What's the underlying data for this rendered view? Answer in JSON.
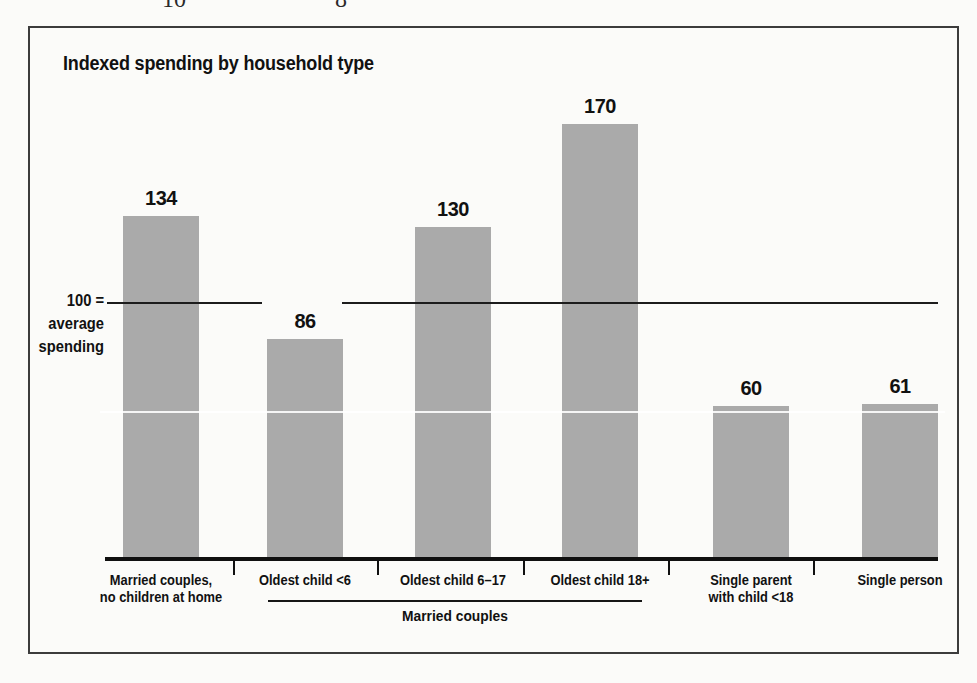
{
  "page": {
    "top_fragments": [
      "10",
      "8"
    ]
  },
  "chart": {
    "title": "Indexed spending by household type",
    "reference_line": {
      "lines": [
        "100 =",
        "average",
        "spending"
      ],
      "value": 100
    },
    "group_bracket_label": "Married couples",
    "colors": {
      "bar_fill": "#aaaaaa",
      "line": "#1c1c1c",
      "frame_border": "#3c3c3c",
      "text": "#111111",
      "background": "#fbfbf9"
    }
  },
  "chart_data": {
    "type": "bar",
    "title": "Indexed spending by household type",
    "categories": [
      "Married couples,\nno children at home",
      "Oldest child <6",
      "Oldest child 6–17",
      "Oldest child 18+",
      "Single parent\nwith child <18",
      "Single person"
    ],
    "values": [
      134,
      86,
      130,
      170,
      60,
      61
    ],
    "data_labels": [
      134,
      86,
      130,
      170,
      60,
      61
    ],
    "reference_line": {
      "value": 100,
      "label": "100 = average spending"
    },
    "group_annotation": {
      "label": "Married couples",
      "spans_categories": [
        "Oldest child <6",
        "Oldest child 6–17",
        "Oldest child 18+"
      ]
    },
    "xlabel": "",
    "ylabel": "",
    "ylim": [
      0,
      195
    ],
    "gridlines": false,
    "legend": false,
    "bar_style": "gray halftone"
  }
}
